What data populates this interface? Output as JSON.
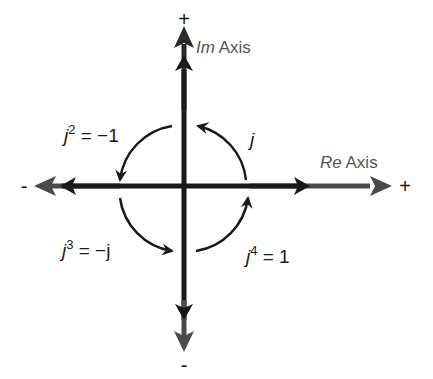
{
  "diagram": {
    "axes": {
      "imaginary": {
        "name_italic": "Im",
        "name_rest": " Axis",
        "positive": "+",
        "negative": "-"
      },
      "real": {
        "name_italic": "Re",
        "name_rest": " Axis",
        "positive": "+",
        "negative": "-"
      }
    },
    "rotations": [
      {
        "quadrant": "I",
        "base": "j",
        "exp": "",
        "rhs": ""
      },
      {
        "quadrant": "II",
        "base": "j",
        "exp": "2",
        "rhs": " = −1"
      },
      {
        "quadrant": "III",
        "base": "j",
        "exp": "3",
        "rhs": " = −j"
      },
      {
        "quadrant": "IV",
        "base": "j",
        "exp": "4",
        "rhs": " = 1"
      }
    ],
    "colors": {
      "axis_dark": "#1a1a1a",
      "axis_outer": "#4a4a4a",
      "label_gray": "#555555",
      "background": "#ffffff"
    }
  }
}
